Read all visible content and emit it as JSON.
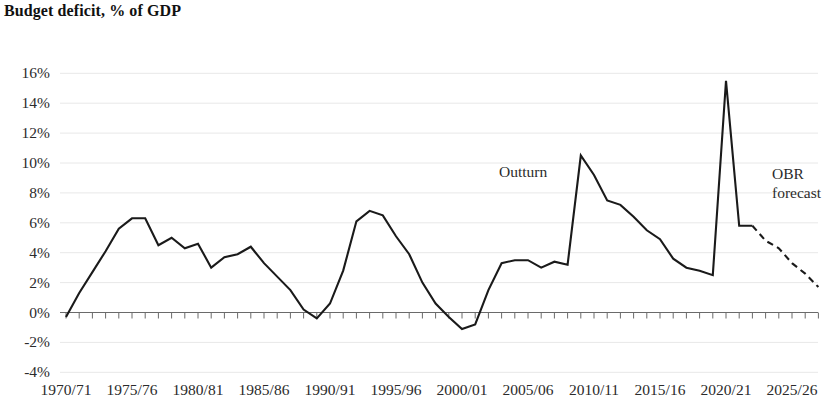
{
  "chart_title": "Budget deficit, % of GDP",
  "annotations": {
    "outturn": "Outturn",
    "obr_line1": "OBR",
    "obr_line2": "forecast"
  },
  "axis": {
    "y_ticks": [
      "16%",
      "14%",
      "12%",
      "10%",
      "8%",
      "6%",
      "4%",
      "2%",
      "0%",
      "-2%",
      "-4%"
    ],
    "x_ticks": [
      "1970/71",
      "1975/76",
      "1980/81",
      "1985/86",
      "1990/91",
      "1995/96",
      "2000/01",
      "2005/06",
      "2010/11",
      "2015/16",
      "2020/21",
      "2025/26"
    ]
  },
  "colors": {
    "line": "#1a1a1a",
    "axis": "#555555",
    "gridline": "#e8e8e8",
    "text": "#2b2b2b"
  },
  "chart_data": {
    "type": "line",
    "title": "Budget deficit, % of GDP",
    "xlabel": "",
    "ylabel": "% of GDP",
    "ylim": [
      -4,
      16
    ],
    "xlim": [
      1970,
      2027
    ],
    "grid": true,
    "legend": "inline-annotations",
    "y_tick_values": [
      16,
      14,
      12,
      10,
      8,
      6,
      4,
      2,
      0,
      -2,
      -4
    ],
    "x_tick_values": [
      1970,
      1975,
      1980,
      1985,
      1990,
      1995,
      2000,
      2005,
      2010,
      2015,
      2020,
      2025
    ],
    "x_tick_labels": [
      "1970/71",
      "1975/76",
      "1980/81",
      "1985/86",
      "1990/91",
      "1995/96",
      "2000/01",
      "2005/06",
      "2010/11",
      "2015/16",
      "2020/21",
      "2025/26"
    ],
    "series": [
      {
        "name": "Outturn",
        "style": "solid",
        "x": [
          1970,
          1971,
          1972,
          1973,
          1974,
          1975,
          1976,
          1977,
          1978,
          1979,
          1980,
          1981,
          1982,
          1983,
          1984,
          1985,
          1986,
          1987,
          1988,
          1989,
          1990,
          1991,
          1992,
          1993,
          1994,
          1995,
          1996,
          1997,
          1998,
          1999,
          2000,
          2001,
          2002,
          2003,
          2004,
          2005,
          2006,
          2007,
          2008,
          2009,
          2010,
          2011,
          2012,
          2013,
          2014,
          2015,
          2016,
          2017,
          2018,
          2019,
          2020,
          2021,
          2022
        ],
        "values": [
          -0.3,
          1.3,
          2.7,
          4.1,
          5.6,
          6.3,
          6.3,
          4.5,
          5.0,
          4.3,
          4.6,
          3.0,
          3.7,
          3.9,
          4.4,
          3.3,
          2.4,
          1.5,
          0.2,
          -0.4,
          0.6,
          2.8,
          6.1,
          6.8,
          6.5,
          5.1,
          3.9,
          2.0,
          0.6,
          -0.3,
          -1.1,
          -0.8,
          1.5,
          3.3,
          3.5,
          3.5,
          3.0,
          3.4,
          3.2,
          10.5,
          9.2,
          7.5,
          7.2,
          6.4,
          5.5,
          4.9,
          3.6,
          3.0,
          2.8,
          2.5,
          15.5,
          5.8,
          5.8
        ]
      },
      {
        "name": "OBR forecast",
        "style": "dashed",
        "x": [
          2022,
          2023,
          2024,
          2025,
          2026,
          2027
        ],
        "values": [
          5.8,
          4.8,
          4.3,
          3.3,
          2.6,
          1.7
        ]
      }
    ]
  }
}
